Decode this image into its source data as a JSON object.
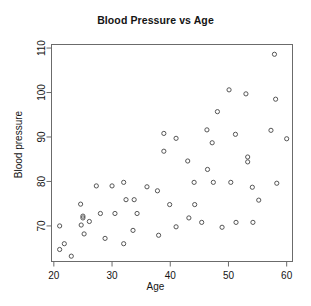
{
  "chart_data": {
    "type": "scatter",
    "title": "Blood Pressure vs Age",
    "xlabel": "Age",
    "ylabel": "Blood pressure",
    "grid": false,
    "legend": null,
    "xlim": [
      19.6,
      61.0
    ],
    "ylim": [
      62.0,
      110.8
    ],
    "xticks": [
      20,
      30,
      40,
      50,
      60
    ],
    "xtick_labels": [
      "20",
      "30",
      "40",
      "50",
      "60"
    ],
    "yticks": [
      70,
      80,
      90,
      100,
      110
    ],
    "ytick_labels": [
      "70",
      "80",
      "90",
      "100",
      "110"
    ],
    "marker": "open-circle",
    "marker_color": "#555555",
    "points": [
      {
        "x": 21.0,
        "y": 70.0
      },
      {
        "x": 21.0,
        "y": 64.7
      },
      {
        "x": 21.8,
        "y": 66.0
      },
      {
        "x": 23.0,
        "y": 63.2
      },
      {
        "x": 24.6,
        "y": 74.9
      },
      {
        "x": 24.7,
        "y": 70.2
      },
      {
        "x": 25.0,
        "y": 72.2
      },
      {
        "x": 25.0,
        "y": 71.8
      },
      {
        "x": 25.2,
        "y": 68.2
      },
      {
        "x": 26.1,
        "y": 71.0
      },
      {
        "x": 27.3,
        "y": 79.0
      },
      {
        "x": 28.0,
        "y": 72.8
      },
      {
        "x": 28.8,
        "y": 67.2
      },
      {
        "x": 30.0,
        "y": 79.0
      },
      {
        "x": 30.5,
        "y": 72.8
      },
      {
        "x": 32.0,
        "y": 79.8
      },
      {
        "x": 32.0,
        "y": 66.0
      },
      {
        "x": 32.4,
        "y": 75.9
      },
      {
        "x": 33.6,
        "y": 69.0
      },
      {
        "x": 33.8,
        "y": 75.9
      },
      {
        "x": 34.3,
        "y": 72.8
      },
      {
        "x": 36.0,
        "y": 78.8
      },
      {
        "x": 37.8,
        "y": 77.9
      },
      {
        "x": 38.0,
        "y": 67.9
      },
      {
        "x": 38.9,
        "y": 90.8
      },
      {
        "x": 38.9,
        "y": 86.8
      },
      {
        "x": 39.9,
        "y": 74.8
      },
      {
        "x": 41.0,
        "y": 89.7
      },
      {
        "x": 41.0,
        "y": 69.8
      },
      {
        "x": 43.0,
        "y": 84.6
      },
      {
        "x": 43.2,
        "y": 71.8
      },
      {
        "x": 44.1,
        "y": 79.8
      },
      {
        "x": 44.2,
        "y": 74.8
      },
      {
        "x": 45.4,
        "y": 70.8
      },
      {
        "x": 46.3,
        "y": 91.6
      },
      {
        "x": 46.4,
        "y": 82.7
      },
      {
        "x": 47.2,
        "y": 88.7
      },
      {
        "x": 47.4,
        "y": 79.8
      },
      {
        "x": 48.1,
        "y": 95.7
      },
      {
        "x": 48.9,
        "y": 69.7
      },
      {
        "x": 50.1,
        "y": 100.6
      },
      {
        "x": 50.4,
        "y": 79.8
      },
      {
        "x": 51.2,
        "y": 90.6
      },
      {
        "x": 51.3,
        "y": 70.8
      },
      {
        "x": 53.0,
        "y": 99.7
      },
      {
        "x": 53.3,
        "y": 85.5
      },
      {
        "x": 53.3,
        "y": 84.4
      },
      {
        "x": 54.1,
        "y": 78.7
      },
      {
        "x": 54.2,
        "y": 70.8
      },
      {
        "x": 55.2,
        "y": 75.8
      },
      {
        "x": 57.3,
        "y": 91.5
      },
      {
        "x": 57.9,
        "y": 108.6
      },
      {
        "x": 58.1,
        "y": 98.5
      },
      {
        "x": 58.3,
        "y": 79.6
      },
      {
        "x": 60.0,
        "y": 89.6
      }
    ]
  }
}
